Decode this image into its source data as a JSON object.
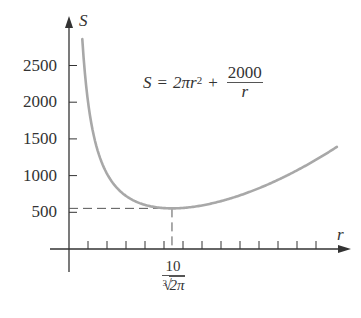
{
  "chart_data": {
    "type": "line",
    "title": "",
    "formula": {
      "lhs": "S",
      "equals": "=",
      "term1": "2πr",
      "term1_exp": "2",
      "plus": "+",
      "frac_num": "2000",
      "frac_den": "r"
    },
    "xlabel": "r",
    "ylabel": "S",
    "y_ticks": [
      500,
      1000,
      1500,
      2000,
      2500
    ],
    "y_tick_labels": [
      "500",
      "1000",
      "1500",
      "2000",
      "2500"
    ],
    "x_tick_count": 13,
    "x_tick_step": 1,
    "xlim": [
      0,
      15
    ],
    "ylim": [
      0,
      3100
    ],
    "minimum": {
      "r_label_num": "10",
      "r_label_root_index": "3",
      "r_label_radicand": "2π",
      "r_value": 5.42,
      "S_value": 553.6
    },
    "series": [
      {
        "name": "S = 2πr² + 2000/r",
        "x": [
          0.7,
          1,
          1.5,
          2,
          2.5,
          3,
          3.5,
          4,
          4.5,
          5,
          5.42,
          6,
          7,
          8,
          9,
          10,
          11,
          12,
          13,
          14.1
        ],
        "y": [
          2860,
          2006,
          1348,
          1025,
          839,
          723,
          648,
          601,
          572,
          557,
          554,
          560,
          594,
          652,
          731,
          828,
          942,
          1072,
          1216,
          1391
        ]
      }
    ],
    "grid": false,
    "legend": "none",
    "guides": "dashed lines from minimum point to both axes"
  },
  "colors": {
    "axis": "#333333",
    "curve": "#a8a8a8",
    "guide": "#555555",
    "text": "#333333"
  }
}
